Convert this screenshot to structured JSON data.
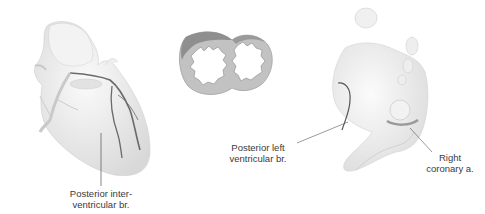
{
  "figure": {
    "panels": [
      {
        "name": "anterior-heart",
        "description": "Heart, anterior-posterior view with coronary branches"
      },
      {
        "name": "cross-section",
        "description": "Ventricular cross-section"
      },
      {
        "name": "inferior-heart",
        "description": "Heart, inferior view"
      }
    ],
    "labels": {
      "posterior_interventricular_1": "Posterior inter-",
      "posterior_interventricular_2": "ventricular br.",
      "posterior_left_1": "Posterior left",
      "posterior_left_2": "ventricular br.",
      "right_coronary_1": "Right",
      "right_coronary_2": "coronary a."
    },
    "colors": {
      "tissue": "#ececec",
      "tissue_shade": "#d6d6d6",
      "vessel": "#6a6a6a",
      "section_ring": "#b5b5b5",
      "section_shade": "#8f8f8f",
      "leader_line": "#555555"
    }
  }
}
